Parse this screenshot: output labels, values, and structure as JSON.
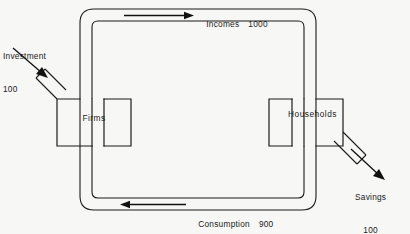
{
  "diagram": {
    "background_color": "#f7f7f5",
    "line_color": "#1b1b1b",
    "nodes": [
      {
        "id": "firms",
        "label": "Firms"
      },
      {
        "id": "households",
        "label": "Households"
      }
    ],
    "flows": [
      {
        "id": "incomes",
        "label": "Incomes",
        "value": "1000",
        "direction": "left-to-right",
        "position": "top"
      },
      {
        "id": "consumption",
        "label": "Consumption",
        "value": "900",
        "direction": "right-to-left",
        "position": "bottom"
      },
      {
        "id": "investment",
        "label": "Investment",
        "value": "100",
        "direction": "into-firms",
        "position": "top-left"
      },
      {
        "id": "savings",
        "label": "Savings",
        "value": "100",
        "direction": "out-of-households",
        "position": "bottom-right"
      }
    ]
  }
}
